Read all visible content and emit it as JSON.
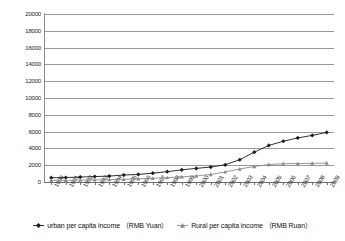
{
  "chart_data": {
    "type": "line",
    "title": "",
    "xlabel": "",
    "ylabel": "",
    "ylim": [
      0,
      20000
    ],
    "ytick_step": 2000,
    "yticks": [
      "20000",
      "18000",
      "16000",
      "14000",
      "12000",
      "10000",
      "8000",
      "6000",
      "4000",
      "2000",
      "0"
    ],
    "grid": true,
    "legend_position": "bottom",
    "categories": [
      "1990",
      "1991",
      "1992",
      "1993",
      "1994",
      "1995",
      "1996",
      "1997",
      "1998",
      "1999",
      "2000",
      "2001",
      "2002",
      "2003",
      "2004",
      "2005",
      "2006",
      "2007",
      "2008",
      "2009"
    ],
    "series": [
      {
        "name": "urban per capita income （RMB Yuan）",
        "marker": "diamond",
        "color": "#1b1b1b",
        "values": [
          510,
          530,
          590,
          650,
          700,
          830,
          900,
          1050,
          1230,
          1450,
          1620,
          1780,
          2050,
          2650,
          3550,
          4350,
          4850,
          5250,
          5550,
          5900
        ]
      },
      {
        "name": "Rural per capita income （RMB Ruan）",
        "marker": "triangle",
        "color": "#8a8a8a",
        "values": [
          190,
          200,
          220,
          250,
          280,
          320,
          380,
          440,
          520,
          620,
          720,
          900,
          1200,
          1550,
          1850,
          2080,
          2170,
          2200,
          2230,
          2250
        ]
      }
    ],
    "series_full": [
      {
        "name": "urban per capita income （RMB Yuan）",
        "marker": "diamond",
        "color": "#1b1b1b",
        "values": [
          510,
          530,
          590,
          650,
          700,
          830,
          900,
          1050,
          1230,
          1450,
          1620,
          1780,
          2050,
          2650,
          3550,
          4350,
          4850,
          5250,
          5550,
          5900,
          6300,
          6900,
          7700,
          8500,
          9400,
          10500,
          11800,
          13800,
          15800,
          17175
        ]
      }
    ]
  },
  "legend": {
    "items": [
      {
        "label": "urban per capita income （RMB Yuan）",
        "marker": "diamond-marker-icon"
      },
      {
        "label": "Rural per capita income （RMB Ruan）",
        "marker": "triangle-marker-icon"
      }
    ]
  }
}
